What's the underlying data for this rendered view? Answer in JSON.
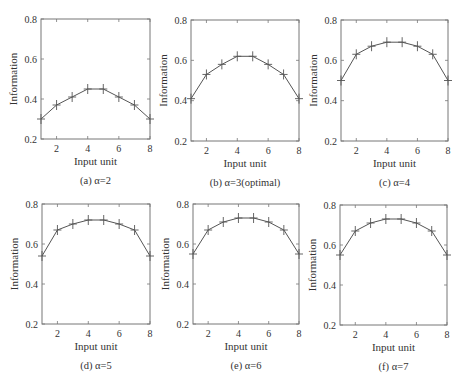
{
  "chart_data": [
    {
      "type": "line",
      "caption": "(a) α=2",
      "xlabel": "Input unit",
      "ylabel": "Information",
      "xlim": [
        1,
        8
      ],
      "ylim": [
        0.2,
        0.8
      ],
      "xticks": [
        "2",
        "4",
        "6",
        "8"
      ],
      "yticks": [
        "0.2",
        "0.4",
        "0.6",
        "0.8"
      ],
      "x": [
        1,
        2,
        3,
        4,
        5,
        6,
        7,
        8
      ],
      "values": [
        0.3,
        0.37,
        0.41,
        0.45,
        0.45,
        0.41,
        0.37,
        0.3
      ],
      "marker": "+"
    },
    {
      "type": "line",
      "caption": "(b) α=3(optimal)",
      "xlabel": "Input unit",
      "ylabel": "Information",
      "xlim": [
        1,
        8
      ],
      "ylim": [
        0.2,
        0.8
      ],
      "xticks": [
        "2",
        "4",
        "6",
        "8"
      ],
      "yticks": [
        "0.2",
        "0.4",
        "0.6",
        "0.8"
      ],
      "x": [
        1,
        2,
        3,
        4,
        5,
        6,
        7,
        8
      ],
      "values": [
        0.41,
        0.53,
        0.58,
        0.62,
        0.62,
        0.58,
        0.53,
        0.41
      ],
      "marker": "+"
    },
    {
      "type": "line",
      "caption": "(c) α=4",
      "xlabel": "Input unit",
      "ylabel": "Information",
      "xlim": [
        1,
        8
      ],
      "ylim": [
        0.2,
        0.8
      ],
      "xticks": [
        "2",
        "4",
        "6",
        "8"
      ],
      "yticks": [
        "0.2",
        "0.4",
        "0.6",
        "0.8"
      ],
      "x": [
        1,
        2,
        3,
        4,
        5,
        6,
        7,
        8
      ],
      "values": [
        0.5,
        0.63,
        0.67,
        0.69,
        0.69,
        0.67,
        0.63,
        0.5
      ],
      "marker": "+"
    },
    {
      "type": "line",
      "caption": "(d) α=5",
      "xlabel": "Input unit",
      "ylabel": "Information",
      "xlim": [
        1,
        8
      ],
      "ylim": [
        0.2,
        0.8
      ],
      "xticks": [
        "2",
        "4",
        "6",
        "8"
      ],
      "yticks": [
        "0.2",
        "0.4",
        "0.6",
        "0.8"
      ],
      "x": [
        1,
        2,
        3,
        4,
        5,
        6,
        7,
        8
      ],
      "values": [
        0.54,
        0.67,
        0.7,
        0.72,
        0.72,
        0.7,
        0.67,
        0.54
      ],
      "marker": "+"
    },
    {
      "type": "line",
      "caption": "(e) α=6",
      "xlabel": "Input unit",
      "ylabel": "Information",
      "xlim": [
        1,
        8
      ],
      "ylim": [
        0.2,
        0.8
      ],
      "xticks": [
        "2",
        "4",
        "6",
        "8"
      ],
      "yticks": [
        "0.2",
        "0.4",
        "0.6",
        "0.8"
      ],
      "x": [
        1,
        2,
        3,
        4,
        5,
        6,
        7,
        8
      ],
      "values": [
        0.55,
        0.67,
        0.71,
        0.73,
        0.73,
        0.71,
        0.67,
        0.55
      ],
      "marker": "+"
    },
    {
      "type": "line",
      "caption": "(f) α=7",
      "xlabel": "Input unit",
      "ylabel": "Information",
      "xlim": [
        1,
        8
      ],
      "ylim": [
        0.2,
        0.8
      ],
      "xticks": [
        "2",
        "4",
        "6",
        "8"
      ],
      "yticks": [
        "0.2",
        "0.4",
        "0.6",
        "0.8"
      ],
      "x": [
        1,
        2,
        3,
        4,
        5,
        6,
        7,
        8
      ],
      "values": [
        0.55,
        0.67,
        0.71,
        0.73,
        0.73,
        0.71,
        0.67,
        0.55
      ],
      "marker": "+"
    }
  ]
}
